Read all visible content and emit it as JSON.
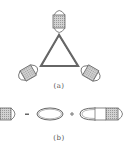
{
  "figure": {
    "panel_a": {
      "label": "(a)",
      "description": "Triangle diagram with three dressed (hatched) vertex blobs"
    },
    "panel_b": {
      "label": "(b)",
      "equation": {
        "lhs": "dressed-propagator",
        "op1": "=",
        "term1": "bare-loop",
        "op2": "+",
        "term2": "loop-with-dressed-insertion"
      }
    }
  },
  "colors": {
    "line": "#555555",
    "hatch_fill": "#c8c8c8",
    "hatch_line": "#8a8a8a",
    "background": "#ffffff"
  }
}
